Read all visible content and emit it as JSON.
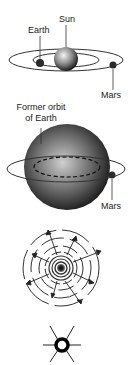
{
  "figure": {
    "panel1": {
      "labels": {
        "sun": "Sun",
        "earth": "Earth",
        "mars": "Mars"
      }
    },
    "panel2": {
      "labels": {
        "former_orbit_line1": "Former orbit",
        "former_orbit_line2": "of Earth",
        "mars": "Mars"
      }
    },
    "panel3": {
      "description": "expanding shells"
    },
    "panel4": {
      "description": "remnant core"
    },
    "colors": {
      "background": "#ffffff",
      "line": "#222222",
      "sphere_light": "#f2f2f2",
      "sphere_dark": "#1a1a1a"
    }
  }
}
